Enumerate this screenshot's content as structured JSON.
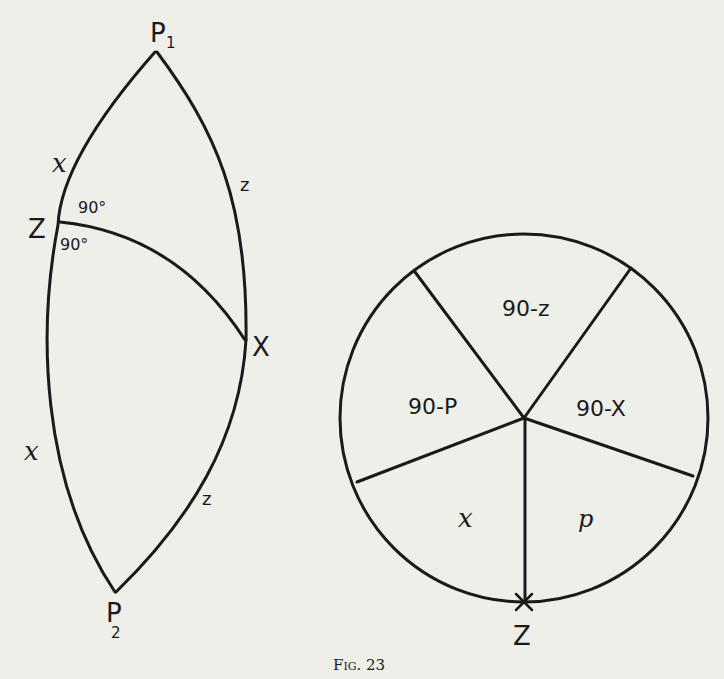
{
  "figure": {
    "caption": "Fig. 23",
    "line_color": "#1a1a1a",
    "background": "#efefea"
  },
  "spherical_triangle": {
    "vertices": {
      "P1": "P1",
      "P1_main": "P",
      "P1_sub": "1",
      "P2_main": "P",
      "P2_sub": "2",
      "Z": "Z",
      "X": "X"
    },
    "side_labels": {
      "upper_left": "x",
      "upper_right": "z",
      "lower_left": "x",
      "lower_right": "z"
    },
    "angle_labels": {
      "upper": "90°",
      "lower": "90°"
    }
  },
  "napier_circle": {
    "segments": {
      "top": "90-z",
      "left": "90-P",
      "right": "90-X",
      "bottom_left": "x",
      "bottom_right": "p"
    },
    "bottom_point_label": "Z"
  }
}
